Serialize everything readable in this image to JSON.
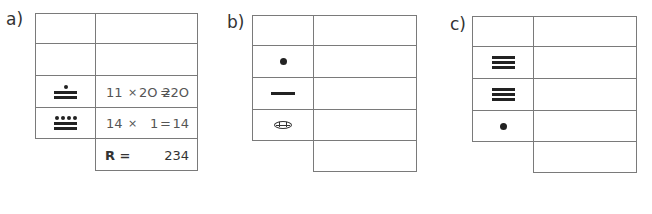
{
  "exercises": [
    {
      "label": "a)",
      "rows": [
        {
          "glyph": "",
          "glyph_value": null,
          "calc": ""
        },
        {
          "glyph": "",
          "glyph_value": null,
          "calc": ""
        },
        {
          "glyph": "mayan-11",
          "glyph_value": 11,
          "calc": "11  × 2O = 22O",
          "calc_parts": [
            "11",
            "×",
            "2O",
            "=",
            "22O"
          ]
        },
        {
          "glyph": "mayan-14",
          "glyph_value": 14,
          "calc": "14 ×    1 =    14",
          "calc_parts": [
            "14",
            "×",
            "1",
            "=",
            "14"
          ]
        }
      ],
      "result": {
        "label": "R =",
        "value": "234"
      }
    },
    {
      "label": "b)",
      "rows": [
        {
          "glyph": "",
          "glyph_value": null,
          "calc": ""
        },
        {
          "glyph": "mayan-1",
          "glyph_value": 1,
          "calc": ""
        },
        {
          "glyph": "mayan-5",
          "glyph_value": 5,
          "calc": ""
        },
        {
          "glyph": "mayan-0",
          "glyph_value": 0,
          "calc": ""
        }
      ],
      "result": {
        "label": "",
        "value": ""
      }
    },
    {
      "label": "c)",
      "rows": [
        {
          "glyph": "",
          "glyph_value": null,
          "calc": ""
        },
        {
          "glyph": "mayan-15",
          "glyph_value": 15,
          "calc": ""
        },
        {
          "glyph": "mayan-15",
          "glyph_value": 15,
          "calc": ""
        },
        {
          "glyph": "mayan-1",
          "glyph_value": 1,
          "calc": ""
        }
      ],
      "result": {
        "label": "",
        "value": ""
      }
    }
  ]
}
